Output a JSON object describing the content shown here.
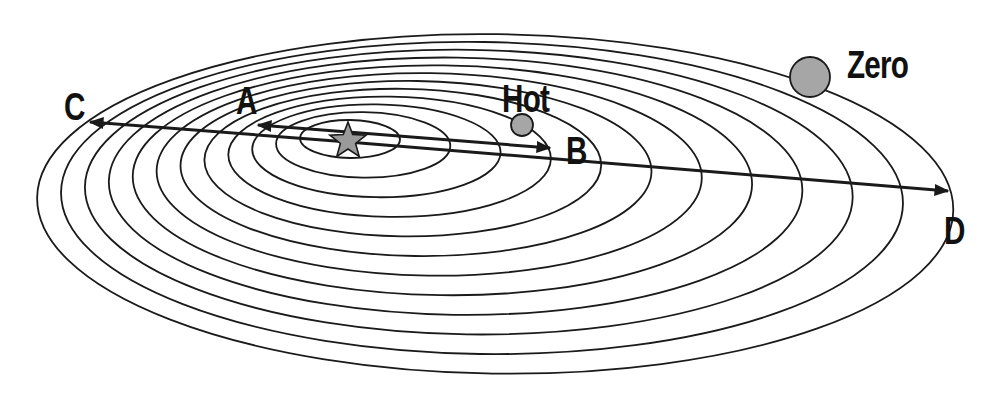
{
  "diagram": {
    "colors": {
      "stroke": "#1a1a1a",
      "planet_fill": "#a6a6a6",
      "star_fill": "#9a9a9a",
      "background": "#ffffff"
    },
    "orbits": {
      "count": 12,
      "innermost": {
        "cx": 350,
        "cy": 139,
        "rx": 50,
        "ry": 19
      },
      "step": {
        "cx": 13.2,
        "cy": 5.9,
        "rx": 37.1,
        "ry": 13.7
      },
      "tilt_deg": 0.8
    },
    "star": {
      "name": "star",
      "x": 348,
      "y": 139,
      "radius": 19
    },
    "planets": [
      {
        "name": "Hot",
        "x": 522,
        "y": 125,
        "radius": 11
      },
      {
        "name": "Zero",
        "x": 810,
        "y": 77,
        "radius": 20
      }
    ],
    "labels": {
      "a": "A",
      "b": "B",
      "c": "C",
      "d": "D",
      "hot": "Hot",
      "zero": "Zero"
    },
    "arrows": [
      {
        "name": "arrow-to-C",
        "from": [
          348,
          142
        ],
        "to": [
          90,
          122
        ]
      },
      {
        "name": "arrow-to-D",
        "from": [
          348,
          142
        ],
        "to": [
          948,
          191
        ]
      },
      {
        "name": "arrow-to-A",
        "from": [
          348,
          132
        ],
        "to": [
          258,
          125
        ]
      },
      {
        "name": "arrow-to-B",
        "from": [
          348,
          132
        ],
        "to": [
          550,
          148
        ]
      }
    ]
  }
}
